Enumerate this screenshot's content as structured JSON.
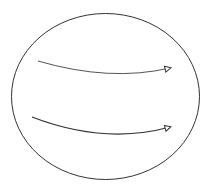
{
  "diagram": {
    "shape": "ellipse",
    "stroke_color": "#333333",
    "ellipse": {
      "cx": 105.5,
      "cy": 96.5,
      "rx": 94,
      "ry": 83
    },
    "arrows": [
      {
        "name": "top-arrow",
        "path": "M38,61 Q110,82 170,68",
        "stroke": "#555555",
        "head": "open-triangle"
      },
      {
        "name": "bottom-arrow",
        "path": "M32,117 Q105,145 170,127",
        "stroke": "#333333",
        "head": "open-triangle"
      }
    ]
  }
}
